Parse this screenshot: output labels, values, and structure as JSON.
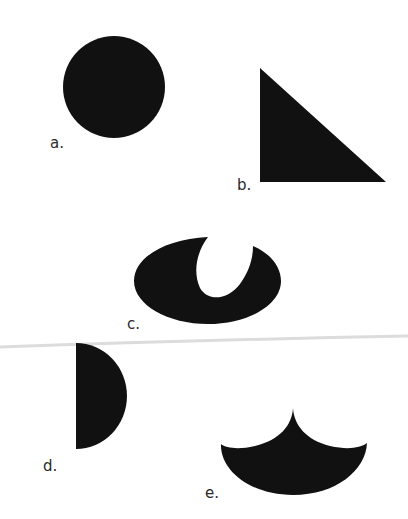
{
  "figure": {
    "shapes": [
      {
        "id": "a",
        "label": "a.",
        "name": "circle"
      },
      {
        "id": "b",
        "label": "b.",
        "name": "right-triangle"
      },
      {
        "id": "c",
        "label": "c.",
        "name": "ellipse-with-notch"
      },
      {
        "id": "d",
        "label": "d.",
        "name": "semicircle"
      },
      {
        "id": "e",
        "label": "e.",
        "name": "concave-cusp-shape"
      }
    ],
    "colors": {
      "fill": "#111111",
      "background": "#ffffff",
      "fold_line": "#d8d8d8"
    }
  }
}
